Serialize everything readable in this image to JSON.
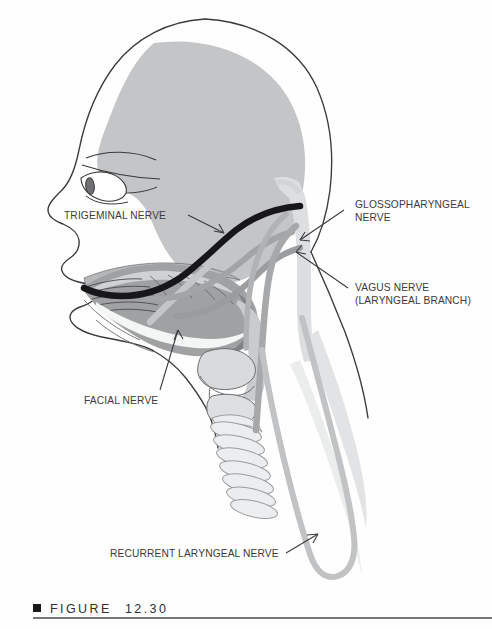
{
  "figure": {
    "caption_label": "FIGURE",
    "caption_number": "12.30",
    "bullet_icon": "black-square-bullet"
  },
  "labels": {
    "trigeminal": "TRIGEMINAL NERVE",
    "glossopharyngeal_line1": "GLOSSOPHARYNGEAL",
    "glossopharyngeal_line2": "NERVE",
    "vagus_line1": "VAGUS NERVE",
    "vagus_line2": "(LARYNGEAL BRANCH)",
    "facial": "FACIAL NERVE",
    "recurrent_laryngeal": "RECURRENT LARYNGEAL NERVE"
  },
  "colors": {
    "page_background": "#fefefe",
    "outline": "#3a3a3c",
    "brain_fill": "#c3c5c7",
    "nerve_dark": "#1a1a1a",
    "nerve_mid": "#8e9092",
    "nerve_light": "#b9bbbd",
    "tissue_light": "#dcdedf",
    "tissue_mid": "#a9abad",
    "tongue_fill": "#9fa1a3",
    "caption_rule": "#4a4a4c",
    "label_text": "#3b3b3d"
  },
  "anatomy": {
    "parts": [
      {
        "name": "head-profile-outline",
        "kind": "outline"
      },
      {
        "name": "brain-cerebrum",
        "kind": "fill"
      },
      {
        "name": "eye",
        "kind": "detail"
      },
      {
        "name": "eyebrow",
        "kind": "detail"
      },
      {
        "name": "tongue",
        "kind": "fill"
      },
      {
        "name": "hard-palate",
        "kind": "detail"
      },
      {
        "name": "pharynx",
        "kind": "fill"
      },
      {
        "name": "larynx-thyroid-cartilage",
        "kind": "outline"
      },
      {
        "name": "trachea-rings",
        "kind": "outline"
      },
      {
        "name": "brainstem-spinal-cord",
        "kind": "fill"
      },
      {
        "name": "neck-outline",
        "kind": "outline"
      }
    ],
    "nerves": [
      {
        "name": "trigeminal-nerve",
        "shade": "dark"
      },
      {
        "name": "facial-nerve",
        "shade": "light"
      },
      {
        "name": "glossopharyngeal-nerve",
        "shade": "mid"
      },
      {
        "name": "vagus-nerve",
        "shade": "mid"
      },
      {
        "name": "recurrent-laryngeal-nerve",
        "shade": "light"
      }
    ]
  }
}
